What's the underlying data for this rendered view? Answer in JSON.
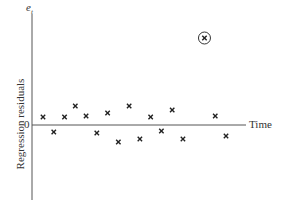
{
  "chart_data": {
    "type": "scatter",
    "title": "",
    "xlabel": "Time",
    "ylabel": "Regression residuals",
    "y_symbol": "e",
    "y_symbol_sub": "t",
    "y_zero_label": "0",
    "grid": false,
    "legend": null,
    "marker": "x",
    "points": [
      {
        "x": 1,
        "y": 0.8
      },
      {
        "x": 2,
        "y": -0.7
      },
      {
        "x": 3,
        "y": 0.8
      },
      {
        "x": 4,
        "y": 1.9
      },
      {
        "x": 5,
        "y": 0.9
      },
      {
        "x": 6,
        "y": -0.8
      },
      {
        "x": 7,
        "y": 1.2
      },
      {
        "x": 8,
        "y": -1.7
      },
      {
        "x": 9,
        "y": 1.9
      },
      {
        "x": 10,
        "y": -1.4
      },
      {
        "x": 11,
        "y": 0.8
      },
      {
        "x": 12,
        "y": -0.6
      },
      {
        "x": 13,
        "y": 1.5
      },
      {
        "x": 14,
        "y": -1.4
      },
      {
        "x": 16,
        "y": 8.7,
        "outlier": true,
        "circled": true
      },
      {
        "x": 17,
        "y": 0.9
      },
      {
        "x": 18,
        "y": -1.1
      }
    ],
    "annotations": [
      "Circled outlier point at high positive residual"
    ]
  }
}
